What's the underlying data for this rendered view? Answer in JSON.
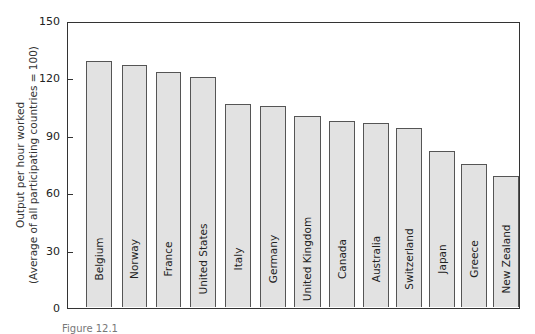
{
  "chart_data": {
    "type": "bar",
    "title": "",
    "xlabel": "",
    "ylabel": "Output per hour worked (Average of all participating countries = 100)",
    "ylabel_lines": [
      "Output per hour worked",
      "(Average of all participating countries = 100)"
    ],
    "ylim": [
      0,
      150
    ],
    "yticks": [
      0,
      30,
      60,
      90,
      120,
      150
    ],
    "grid": false,
    "legend": null,
    "categories": [
      "Belgium",
      "Norway",
      "France",
      "United States",
      "Italy",
      "Germany",
      "United Kingdom",
      "Canada",
      "Australia",
      "Switzerland",
      "Japan",
      "Greece",
      "New Zealand"
    ],
    "values": [
      128.5,
      126.5,
      123,
      120,
      106,
      105,
      100,
      97,
      96,
      93.5,
      81.5,
      74.5,
      68.5
    ],
    "bar_color": "#e2e2e2",
    "bar_edge_color": "#555555",
    "labels_inside_bars": true
  },
  "caption": "Figure 12.1"
}
